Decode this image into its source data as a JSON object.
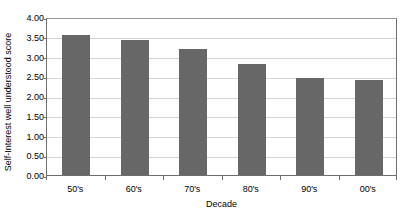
{
  "chart_data": {
    "type": "bar",
    "title": "",
    "xlabel": "Decade",
    "ylabel": "Self-Interest well understood score",
    "categories": [
      "50's",
      "60's",
      "70's",
      "80's",
      "90's",
      "00's"
    ],
    "values": [
      3.55,
      3.43,
      3.2,
      2.8,
      2.45,
      2.4
    ],
    "ylim": [
      0.0,
      4.0
    ],
    "ytick_step": 0.5,
    "ytick_labels": [
      "0.00",
      "0.50",
      "1.00",
      "1.50",
      "2.00",
      "2.50",
      "3.00",
      "3.50",
      "4.00"
    ],
    "ytick_values": [
      0.0,
      0.5,
      1.0,
      1.5,
      2.0,
      2.5,
      3.0,
      3.5,
      4.0
    ],
    "grid": true,
    "legend": false,
    "legend_position": "none",
    "series": [
      {
        "name": "Self-Interest well understood score",
        "color": "#676767",
        "values": [
          3.55,
          3.43,
          3.2,
          2.8,
          2.45,
          2.4
        ]
      }
    ],
    "colors": {
      "bar": "#676767",
      "gridline": "#d4d4d4",
      "axis": "#6e6e6e",
      "background": "#ffffff",
      "text": "#000000"
    }
  }
}
